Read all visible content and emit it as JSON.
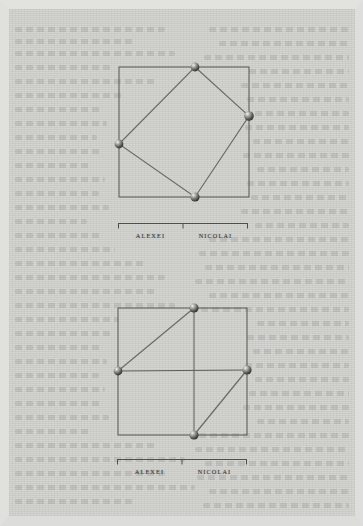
{
  "page": {
    "kind": "scanned-book-page-with-diagrams",
    "paper_color": "#d0d0cc",
    "ink_color": "#4a4a48",
    "margin_color": "#e0e0dd"
  },
  "figures": [
    {
      "id": "figure-top",
      "name": "inscribed-tilted-square",
      "outer_square": {
        "x": 0,
        "y": 0,
        "w": 130,
        "h": 130
      },
      "vertices": [
        {
          "name": "top-vertex",
          "x": 76,
          "y": 0
        },
        {
          "name": "right-vertex",
          "x": 130,
          "y": 49
        },
        {
          "name": "bottom-vertex",
          "x": 76,
          "y": 130
        },
        {
          "name": "left-vertex",
          "x": 0,
          "y": 77
        }
      ],
      "inner_polygon": "76,0 130,49 76,130 0,77",
      "cross_lines": [],
      "diagonals": [],
      "bracket": {
        "segments": [
          {
            "label": "ALEXEI"
          },
          {
            "label": "NICOLAI"
          }
        ]
      }
    },
    {
      "id": "figure-bottom",
      "name": "quartered-square-with-diagonals",
      "outer_square": {
        "x": 0,
        "y": 0,
        "w": 129,
        "h": 127
      },
      "vertices": [
        {
          "name": "top-vertex",
          "x": 76,
          "y": 0
        },
        {
          "name": "right-vertex",
          "x": 129,
          "y": 62
        },
        {
          "name": "bottom-vertex",
          "x": 76,
          "y": 127
        },
        {
          "name": "left-vertex",
          "x": 0,
          "y": 63
        }
      ],
      "cross_lines": [
        {
          "name": "vertical-midline",
          "x1": 76,
          "y1": 0,
          "x2": 76,
          "y2": 127
        },
        {
          "name": "horizontal-midline",
          "x1": 0,
          "y1": 63,
          "x2": 129,
          "y2": 62
        }
      ],
      "diagonals": [
        {
          "name": "upper-left-diagonal",
          "x1": 0,
          "y1": 63,
          "x2": 76,
          "y2": 0
        },
        {
          "name": "lower-right-diagonal",
          "x1": 76,
          "y1": 127,
          "x2": 129,
          "y2": 62
        }
      ],
      "bracket": {
        "segments": [
          {
            "label": "ALEXEI"
          },
          {
            "label": "NICOLAI"
          }
        ]
      }
    }
  ],
  "bleed_lines": [
    {
      "x": 6,
      "y": 18,
      "w": 150
    },
    {
      "x": 6,
      "y": 30,
      "w": 120
    },
    {
      "x": 6,
      "y": 42,
      "w": 160
    },
    {
      "x": 6,
      "y": 56,
      "w": 96
    },
    {
      "x": 6,
      "y": 70,
      "w": 140
    },
    {
      "x": 6,
      "y": 84,
      "w": 110
    },
    {
      "x": 6,
      "y": 98,
      "w": 86
    },
    {
      "x": 6,
      "y": 112,
      "w": 92
    },
    {
      "x": 6,
      "y": 126,
      "w": 82
    },
    {
      "x": 6,
      "y": 140,
      "w": 88
    },
    {
      "x": 6,
      "y": 154,
      "w": 76
    },
    {
      "x": 6,
      "y": 168,
      "w": 90
    },
    {
      "x": 6,
      "y": 182,
      "w": 84
    },
    {
      "x": 6,
      "y": 196,
      "w": 94
    },
    {
      "x": 6,
      "y": 210,
      "w": 72
    },
    {
      "x": 6,
      "y": 224,
      "w": 88
    },
    {
      "x": 6,
      "y": 238,
      "w": 100
    },
    {
      "x": 6,
      "y": 252,
      "w": 130
    },
    {
      "x": 6,
      "y": 266,
      "w": 150
    },
    {
      "x": 6,
      "y": 280,
      "w": 140
    },
    {
      "x": 6,
      "y": 294,
      "w": 160
    },
    {
      "x": 6,
      "y": 308,
      "w": 104
    },
    {
      "x": 6,
      "y": 322,
      "w": 96
    },
    {
      "x": 6,
      "y": 336,
      "w": 88
    },
    {
      "x": 6,
      "y": 350,
      "w": 92
    },
    {
      "x": 6,
      "y": 364,
      "w": 84
    },
    {
      "x": 6,
      "y": 378,
      "w": 90
    },
    {
      "x": 6,
      "y": 392,
      "w": 86
    },
    {
      "x": 6,
      "y": 406,
      "w": 94
    },
    {
      "x": 6,
      "y": 420,
      "w": 76
    },
    {
      "x": 6,
      "y": 434,
      "w": 140
    },
    {
      "x": 6,
      "y": 448,
      "w": 170
    },
    {
      "x": 6,
      "y": 462,
      "w": 150
    },
    {
      "x": 6,
      "y": 476,
      "w": 180
    },
    {
      "x": 6,
      "y": 490,
      "w": 120
    },
    {
      "x": 200,
      "y": 18,
      "w": 140
    },
    {
      "x": 210,
      "y": 32,
      "w": 130
    },
    {
      "x": 195,
      "y": 46,
      "w": 145
    },
    {
      "x": 240,
      "y": 60,
      "w": 100
    },
    {
      "x": 232,
      "y": 74,
      "w": 108
    },
    {
      "x": 238,
      "y": 88,
      "w": 102
    },
    {
      "x": 246,
      "y": 102,
      "w": 94
    },
    {
      "x": 236,
      "y": 116,
      "w": 104
    },
    {
      "x": 244,
      "y": 130,
      "w": 96
    },
    {
      "x": 234,
      "y": 144,
      "w": 106
    },
    {
      "x": 248,
      "y": 158,
      "w": 92
    },
    {
      "x": 238,
      "y": 172,
      "w": 102
    },
    {
      "x": 242,
      "y": 186,
      "w": 98
    },
    {
      "x": 232,
      "y": 200,
      "w": 108
    },
    {
      "x": 246,
      "y": 214,
      "w": 94
    },
    {
      "x": 200,
      "y": 228,
      "w": 140
    },
    {
      "x": 190,
      "y": 242,
      "w": 150
    },
    {
      "x": 196,
      "y": 256,
      "w": 144
    },
    {
      "x": 186,
      "y": 270,
      "w": 154
    },
    {
      "x": 200,
      "y": 284,
      "w": 140
    },
    {
      "x": 192,
      "y": 298,
      "w": 148
    },
    {
      "x": 248,
      "y": 312,
      "w": 92
    },
    {
      "x": 238,
      "y": 326,
      "w": 102
    },
    {
      "x": 244,
      "y": 340,
      "w": 96
    },
    {
      "x": 236,
      "y": 354,
      "w": 104
    },
    {
      "x": 246,
      "y": 368,
      "w": 94
    },
    {
      "x": 240,
      "y": 382,
      "w": 100
    },
    {
      "x": 234,
      "y": 396,
      "w": 106
    },
    {
      "x": 248,
      "y": 410,
      "w": 92
    },
    {
      "x": 190,
      "y": 424,
      "w": 150
    },
    {
      "x": 186,
      "y": 438,
      "w": 154
    },
    {
      "x": 196,
      "y": 452,
      "w": 144
    },
    {
      "x": 188,
      "y": 466,
      "w": 152
    },
    {
      "x": 200,
      "y": 480,
      "w": 140
    },
    {
      "x": 194,
      "y": 494,
      "w": 146
    }
  ]
}
